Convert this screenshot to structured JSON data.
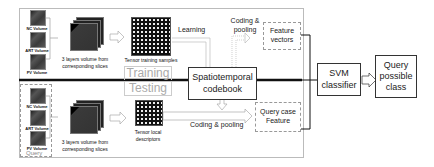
{
  "diagram": {
    "inputs_training": [
      {
        "label": "NC Volume"
      },
      {
        "label": "ART Volume"
      },
      {
        "label": "PV Volume"
      }
    ],
    "inputs_query": [
      {
        "label": "NC Volume"
      },
      {
        "label": "ART Volume"
      },
      {
        "label": "PV Volume"
      }
    ],
    "query_group_label": "Query",
    "volume_training_label": "3 layers volume from corresponding slices",
    "volume_testing_label": "3 layers volume from corresponding slices",
    "tensor_training_label": "Tensor training samples",
    "tensor_testing_label": "Tensor local descriptors",
    "training_label": "Training",
    "testing_label": "Testing",
    "learning_label": "Learning",
    "coding_pooling_top": "Coding & pooling",
    "coding_pooling_bottom": "Coding & pooling",
    "codebook_label": "Spatiotemporal codebook",
    "feature_vectors_label": "Feature vectors",
    "query_feature_label": "Query case Feature",
    "svm_label": "SVM classifier",
    "output_label": "Query possible class"
  }
}
